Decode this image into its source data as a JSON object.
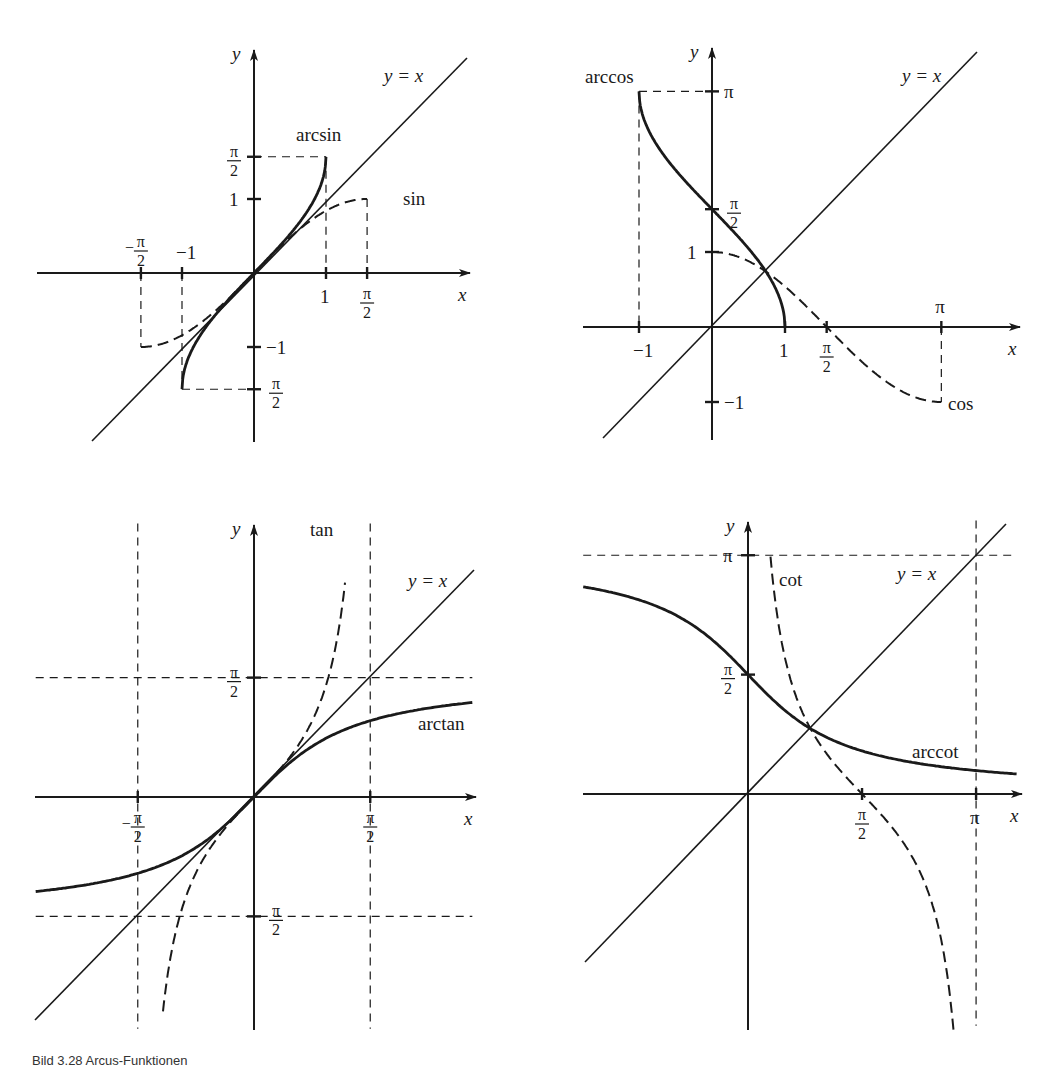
{
  "figure": {
    "caption": "Bild 3.28  Arcus-Funktionen"
  },
  "chart_data": [
    {
      "type": "line",
      "panel": "top-left",
      "title": "",
      "xlabel": "x",
      "ylabel": "y",
      "origin_px": [
        254,
        273
      ],
      "unit_px": [
        72,
        74
      ],
      "x_axis_px": [
        37,
        470
      ],
      "y_axis_px": [
        442,
        50
      ],
      "identity_px": [
        [
          92,
          441
        ],
        [
          467,
          58
        ]
      ],
      "identity_label": "y = x",
      "identity_label_px": [
        384,
        82
      ],
      "x_ticks": [
        {
          "value": -1.5708,
          "label": "-π/2",
          "label_side": "above"
        },
        {
          "value": -1,
          "label": "−1",
          "label_side": "above"
        },
        {
          "value": 1,
          "label": "1",
          "label_side": "below"
        },
        {
          "value": 1.5708,
          "label": "π/2",
          "label_side": "below"
        }
      ],
      "y_ticks": [
        {
          "value": 1.5708,
          "label": "π/2",
          "label_side": "left"
        },
        {
          "value": 1,
          "label": "1",
          "label_side": "left"
        },
        {
          "value": -1,
          "label": "−1",
          "label_side": "right"
        },
        {
          "value": -1.5708,
          "label": "π/2",
          "label_side": "right"
        }
      ],
      "series": [
        {
          "name": "arcsin",
          "fn": "asin",
          "domain": [
            -1,
            1
          ],
          "style": "solid-bold",
          "label_px": [
            296,
            141
          ]
        },
        {
          "name": "sin",
          "fn": "sin",
          "domain": [
            -1.5708,
            1.5708
          ],
          "style": "dashed",
          "label_px": [
            403,
            205
          ]
        }
      ],
      "guides": [
        {
          "from": [
            0,
            1.5708
          ],
          "to": [
            1,
            1.5708
          ]
        },
        {
          "from": [
            1,
            1.5708
          ],
          "to": [
            1,
            0
          ]
        },
        {
          "from": [
            1.5708,
            1
          ],
          "to": [
            1.5708,
            0
          ]
        },
        {
          "from": [
            -1.5708,
            0
          ],
          "to": [
            -1.5708,
            -1
          ]
        },
        {
          "from": [
            -1,
            0
          ],
          "to": [
            -1,
            -1.5708
          ]
        },
        {
          "from": [
            -1,
            -1.5708
          ],
          "to": [
            0,
            -1.5708
          ]
        }
      ]
    },
    {
      "type": "line",
      "panel": "top-right",
      "title": "",
      "xlabel": "x",
      "ylabel": "y",
      "origin_px": [
        712,
        327
      ],
      "unit_px": [
        73,
        75
      ],
      "x_axis_px": [
        583,
        1020
      ],
      "y_axis_px": [
        440,
        48
      ],
      "identity_px": [
        [
          603,
          438
        ],
        [
          977,
          52
        ]
      ],
      "identity_label": "y = x",
      "identity_label_px": [
        902,
        82
      ],
      "x_ticks": [
        {
          "value": -1,
          "label": "−1",
          "label_side": "below"
        },
        {
          "value": 1,
          "label": "1",
          "label_side": "below"
        },
        {
          "value": 1.5708,
          "label": "π/2",
          "label_side": "below"
        },
        {
          "value": 3.1416,
          "label": "π",
          "label_side": "above"
        }
      ],
      "y_ticks": [
        {
          "value": 3.1416,
          "label": "π",
          "label_side": "right"
        },
        {
          "value": 1.5708,
          "label": "π/2",
          "label_side": "right"
        },
        {
          "value": 1,
          "label": "1",
          "label_side": "left"
        },
        {
          "value": -1,
          "label": "−1",
          "label_side": "right"
        }
      ],
      "series": [
        {
          "name": "arccos",
          "fn": "acos",
          "domain": [
            -1,
            1
          ],
          "style": "solid-bold",
          "label_px": [
            585,
            83
          ]
        },
        {
          "name": "cos",
          "fn": "cos",
          "domain": [
            0,
            3.1416
          ],
          "style": "dashed",
          "label_px": [
            948,
            410
          ]
        }
      ],
      "guides": [
        {
          "from": [
            -1,
            3.1416
          ],
          "to": [
            0,
            3.1416
          ]
        },
        {
          "from": [
            -1,
            3.1416
          ],
          "to": [
            -1,
            0
          ]
        },
        {
          "from": [
            3.1416,
            0
          ],
          "to": [
            3.1416,
            -1
          ]
        }
      ]
    },
    {
      "type": "line",
      "panel": "bottom-left",
      "title": "",
      "xlabel": "x",
      "ylabel": "y",
      "origin_px": [
        254,
        797
      ],
      "unit_px": [
        74,
        76
      ],
      "x_axis_px": [
        35,
        476
      ],
      "y_axis_px": [
        1030,
        525
      ],
      "identity_px": [
        [
          35,
          1020
        ],
        [
          474,
          570
        ]
      ],
      "identity_label": "y = x",
      "identity_label_px": [
        408,
        587
      ],
      "x_ticks": [
        {
          "value": -1.5708,
          "label": "-π/2",
          "label_side": "below"
        },
        {
          "value": 1.5708,
          "label": "π/2",
          "label_side": "below"
        }
      ],
      "y_ticks": [
        {
          "value": 1.5708,
          "label": "π/2",
          "label_side": "left"
        },
        {
          "value": -1.5708,
          "label": "π/2",
          "label_side": "right"
        }
      ],
      "series": [
        {
          "name": "arctan",
          "fn": "atan",
          "domain": [
            -2.95,
            2.95
          ],
          "style": "solid-bold",
          "label_px": [
            418,
            730
          ]
        },
        {
          "name": "tan",
          "fn": "tan",
          "domain": [
            -1.23,
            1.23
          ],
          "style": "dashed",
          "label_px": [
            310,
            536
          ]
        }
      ],
      "guides": [
        {
          "from": [
            -1.5708,
            3.6
          ],
          "to": [
            -1.5708,
            -3.05
          ]
        },
        {
          "from": [
            1.5708,
            3.6
          ],
          "to": [
            1.5708,
            -3.05
          ]
        },
        {
          "from": [
            -2.95,
            1.5708
          ],
          "to": [
            2.95,
            1.5708
          ]
        },
        {
          "from": [
            -2.95,
            -1.5708
          ],
          "to": [
            2.95,
            -1.5708
          ]
        }
      ]
    },
    {
      "type": "line",
      "panel": "bottom-right",
      "title": "",
      "xlabel": "x",
      "ylabel": "y",
      "origin_px": [
        748,
        794
      ],
      "unit_px": [
        72.6,
        76
      ],
      "x_axis_px": [
        583,
        1022
      ],
      "y_axis_px": [
        1030,
        522
      ],
      "identity_px": [
        [
          585,
          962
        ],
        [
          1006,
          524
        ]
      ],
      "identity_label": "y = x",
      "identity_label_px": [
        897,
        580
      ],
      "x_ticks": [
        {
          "value": 1.5708,
          "label": "π/2",
          "label_side": "below"
        },
        {
          "value": 3.1416,
          "label": "π",
          "label_side": "below"
        }
      ],
      "y_ticks": [
        {
          "value": 3.1416,
          "label": "π",
          "label_side": "left"
        },
        {
          "value": 1.5708,
          "label": "π/2",
          "label_side": "left"
        }
      ],
      "series": [
        {
          "name": "arccot",
          "fn": "acot",
          "domain": [
            -2.27,
            3.7
          ],
          "style": "solid-bold",
          "label_px": [
            912,
            758
          ]
        },
        {
          "name": "cot",
          "fn": "cot",
          "domain": [
            0.31,
            2.95
          ],
          "style": "dashed",
          "label_px": [
            779,
            586
          ]
        }
      ],
      "guides": [
        {
          "from": [
            -2.27,
            3.1416
          ],
          "to": [
            3.7,
            3.1416
          ]
        },
        {
          "from": [
            3.1416,
            3.6
          ],
          "to": [
            3.1416,
            -3.05
          ]
        }
      ]
    }
  ]
}
